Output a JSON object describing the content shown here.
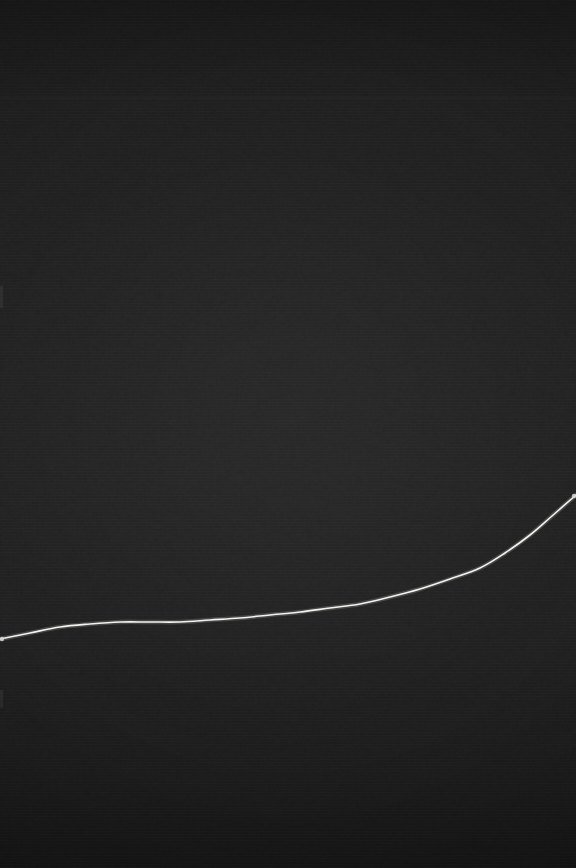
{
  "image": {
    "title": "Dark low-contrast curve plot",
    "width": 576,
    "height": 868,
    "background_color": "#1e1e1e",
    "line_color": "#f2f2ee",
    "faint_line_color": "#2e2e2e",
    "description": "Near-black noisy field with a single thin white curve rising from lower-left to upper-right edge"
  },
  "chart_data": {
    "type": "line",
    "title": "",
    "subtitle": "",
    "xlabel": "",
    "ylabel": "",
    "xlim": [
      0,
      576
    ],
    "ylim": [
      868,
      0
    ],
    "grid": false,
    "legend": null,
    "axis_ticks": {
      "x": [],
      "y": []
    },
    "annotations": [],
    "series": [
      {
        "name": "curve",
        "color": "#f2f2ee",
        "stroke_width": 1.6,
        "x": [
          0,
          30,
          60,
          90,
          120,
          150,
          180,
          210,
          240,
          270,
          300,
          330,
          360,
          390,
          420,
          450,
          480,
          505,
          530,
          552,
          576
        ],
        "y": [
          639,
          633,
          627,
          624,
          622,
          622,
          622,
          620,
          618,
          615,
          612,
          608,
          604,
          597,
          589,
          579,
          568,
          553,
          535,
          516,
          495
        ]
      }
    ],
    "guides": [
      {
        "name": "faint-horizontal-line",
        "orientation": "horizontal",
        "y": 98,
        "x_start": 0,
        "x_end": 576,
        "color": "#2e2e2e",
        "opacity": 0.5
      }
    ],
    "markers": [
      {
        "name": "left-edge-endpoint",
        "x": 2,
        "y": 639,
        "color": "#d8d8d4"
      },
      {
        "name": "right-edge-endpoint",
        "x": 574,
        "y": 496,
        "color": "#d8d8d4"
      }
    ]
  }
}
